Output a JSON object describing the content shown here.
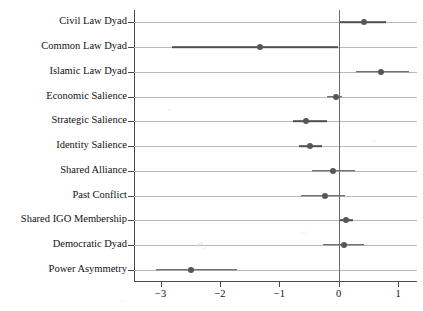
{
  "chart_data": {
    "type": "scatter",
    "title": "",
    "subtitle": "",
    "xlabel": "",
    "ylabel": "",
    "xlim": [
      -3.45,
      1.32
    ],
    "ylim": [
      0,
      12
    ],
    "grid": true,
    "legend": null,
    "orientation": "horizontal",
    "xticks": [
      -3,
      -2,
      -1,
      0,
      1
    ],
    "xticklabels": [
      "−3",
      "−2",
      "−1",
      "0",
      "1"
    ],
    "reference_line": 0,
    "categories": [
      "Civil Law Dyad",
      "Common Law Dyad",
      "Islamic Law Dyad",
      "Economic Salience",
      "Strategic Salience",
      "Identity Salience",
      "Shared Alliance",
      "Past Conflict",
      "Shared IGO Membership",
      "Democratic Dyad",
      "Power Asymmetry"
    ],
    "estimates": [
      0.42,
      -1.33,
      0.72,
      -0.05,
      -0.55,
      -0.48,
      -0.1,
      -0.23,
      0.13,
      0.09,
      -2.49
    ],
    "ci_low": [
      0.01,
      -2.81,
      0.29,
      -0.19,
      -0.77,
      -0.67,
      -0.45,
      -0.64,
      0.02,
      -0.27,
      -3.08
    ],
    "ci_high": [
      0.79,
      -0.02,
      1.19,
      0.06,
      -0.19,
      -0.28,
      0.28,
      0.1,
      0.24,
      0.42,
      -1.71
    ],
    "points": [
      {
        "label": "Civil Law Dyad",
        "estimate": 0.42,
        "ci_low": 0.01,
        "ci_high": 0.79
      },
      {
        "label": "Common Law Dyad",
        "estimate": -1.33,
        "ci_low": -2.81,
        "ci_high": -0.02
      },
      {
        "label": "Islamic Law Dyad",
        "estimate": 0.72,
        "ci_low": 0.29,
        "ci_high": 1.19
      },
      {
        "label": "Economic Salience",
        "estimate": -0.05,
        "ci_low": -0.19,
        "ci_high": 0.06
      },
      {
        "label": "Strategic Salience",
        "estimate": -0.55,
        "ci_low": -0.77,
        "ci_high": -0.19
      },
      {
        "label": "Identity Salience",
        "estimate": -0.48,
        "ci_low": -0.67,
        "ci_high": -0.28
      },
      {
        "label": "Shared Alliance",
        "estimate": -0.1,
        "ci_low": -0.45,
        "ci_high": 0.28
      },
      {
        "label": "Past Conflict",
        "estimate": -0.23,
        "ci_low": -0.64,
        "ci_high": 0.1
      },
      {
        "label": "Shared IGO Membership",
        "estimate": 0.13,
        "ci_low": 0.02,
        "ci_high": 0.24
      },
      {
        "label": "Democratic Dyad",
        "estimate": 0.09,
        "ci_low": -0.27,
        "ci_high": 0.42
      },
      {
        "label": "Power Asymmetry",
        "estimate": -2.49,
        "ci_low": -3.08,
        "ci_high": -1.71
      }
    ],
    "colors": {
      "point": "#565656",
      "interval": "#4f4f4f",
      "gridline": "#b9b9b9",
      "axis": "#4a4a4a",
      "reference": "#6a6a6a",
      "background": "#ffffff"
    }
  }
}
